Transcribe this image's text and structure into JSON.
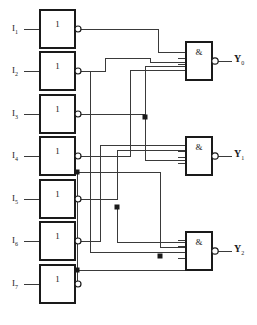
{
  "diagram": {
    "type": "logic-circuit",
    "line_color": "#3a3a3a",
    "box_color": "#1a1a1a",
    "background": "#ffffff"
  },
  "inputs": [
    {
      "name": "I1",
      "label": "I",
      "sub": "1",
      "x": 12,
      "y": 29
    },
    {
      "name": "I2",
      "label": "I",
      "sub": "2",
      "x": 12,
      "y": 71
    },
    {
      "name": "I3",
      "label": "I",
      "sub": "3",
      "x": 12,
      "y": 114
    },
    {
      "name": "I4",
      "label": "I",
      "sub": "4",
      "x": 12,
      "y": 156
    },
    {
      "name": "I5",
      "label": "I",
      "sub": "5",
      "x": 12,
      "y": 199
    },
    {
      "name": "I6",
      "label": "I",
      "sub": "6",
      "x": 12,
      "y": 241
    },
    {
      "name": "I7",
      "label": "I",
      "sub": "7",
      "x": 12,
      "y": 284
    }
  ],
  "inverters": [
    {
      "name": "inverter-1",
      "glyph": "1",
      "x": 40,
      "y": 10,
      "w": 35,
      "h": 38
    },
    {
      "name": "inverter-2",
      "glyph": "1",
      "x": 40,
      "y": 52,
      "w": 35,
      "h": 38
    },
    {
      "name": "inverter-3",
      "glyph": "1",
      "x": 40,
      "y": 95,
      "w": 35,
      "h": 38
    },
    {
      "name": "inverter-4",
      "glyph": "1",
      "x": 40,
      "y": 137,
      "w": 35,
      "h": 38
    },
    {
      "name": "inverter-5",
      "glyph": "1",
      "x": 40,
      "y": 180,
      "w": 35,
      "h": 38
    },
    {
      "name": "inverter-6",
      "glyph": "1",
      "x": 40,
      "y": 222,
      "w": 35,
      "h": 38
    },
    {
      "name": "inverter-7",
      "glyph": "1",
      "x": 40,
      "y": 265,
      "w": 35,
      "h": 38
    }
  ],
  "and_gates": [
    {
      "name": "and-gate-Y0",
      "glyph": "&",
      "x": 186,
      "y": 42,
      "w": 26,
      "h": 38,
      "inputs": 4
    },
    {
      "name": "and-gate-Y1",
      "glyph": "&",
      "x": 186,
      "y": 137,
      "w": 26,
      "h": 38,
      "inputs": 4
    },
    {
      "name": "and-gate-Y2",
      "glyph": "&",
      "x": 186,
      "y": 232,
      "w": 26,
      "h": 38,
      "inputs": 4
    }
  ],
  "outputs": [
    {
      "name": "Y0",
      "label": "Y",
      "sub": "0",
      "x": 234,
      "y": 55
    },
    {
      "name": "Y1",
      "label": "Y",
      "sub": "1",
      "x": 234,
      "y": 150
    },
    {
      "name": "Y2",
      "label": "Y",
      "sub": "2",
      "x": 234,
      "y": 245
    }
  ],
  "junctions": [
    {
      "name": "junction-1",
      "x": 145,
      "y": 117
    },
    {
      "name": "junction-2",
      "x": 77,
      "y": 172
    },
    {
      "name": "junction-3",
      "x": 117,
      "y": 207
    },
    {
      "name": "junction-4",
      "x": 160,
      "y": 256
    },
    {
      "name": "junction-5",
      "x": 77,
      "y": 270
    }
  ]
}
